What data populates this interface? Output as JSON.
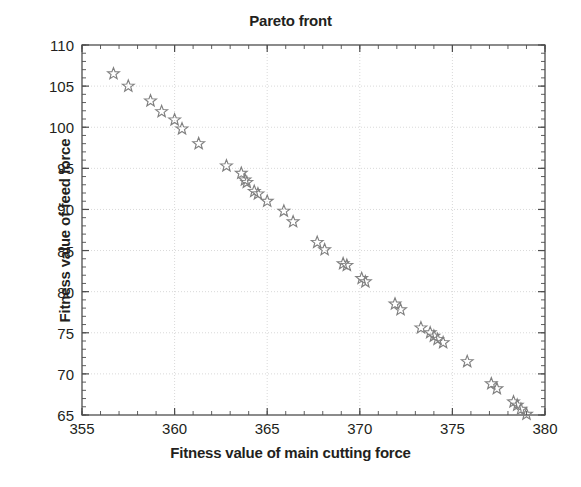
{
  "chart_data": {
    "type": "scatter",
    "title": "Pareto front",
    "xlabel": "Fitness value of main cutting force",
    "ylabel": "Fitness value of feed force",
    "xlim": [
      355,
      380
    ],
    "ylim": [
      65,
      110
    ],
    "xticks": [
      355,
      360,
      365,
      370,
      375,
      380
    ],
    "yticks": [
      65,
      70,
      75,
      80,
      85,
      90,
      95,
      100,
      105,
      110
    ],
    "grid": true,
    "legend": null,
    "marker": "star-outline",
    "marker_color": "#808080",
    "series": [
      {
        "name": "Pareto front solutions",
        "points": [
          [
            356.7,
            106.5
          ],
          [
            357.5,
            105.0
          ],
          [
            358.7,
            103.2
          ],
          [
            359.3,
            101.9
          ],
          [
            360.0,
            100.9
          ],
          [
            360.4,
            99.8
          ],
          [
            361.3,
            98.0
          ],
          [
            362.8,
            95.3
          ],
          [
            363.6,
            94.4
          ],
          [
            363.8,
            93.6
          ],
          [
            363.9,
            93.3
          ],
          [
            364.3,
            92.2
          ],
          [
            364.5,
            91.9
          ],
          [
            365.0,
            91.0
          ],
          [
            365.9,
            89.8
          ],
          [
            366.4,
            88.5
          ],
          [
            367.7,
            86.0
          ],
          [
            368.1,
            85.1
          ],
          [
            369.1,
            83.4
          ],
          [
            369.3,
            83.2
          ],
          [
            370.1,
            81.6
          ],
          [
            370.3,
            81.2
          ],
          [
            371.9,
            78.5
          ],
          [
            372.2,
            77.8
          ],
          [
            373.3,
            75.6
          ],
          [
            373.8,
            75.0
          ],
          [
            374.0,
            74.6
          ],
          [
            374.2,
            74.2
          ],
          [
            374.5,
            73.8
          ],
          [
            375.8,
            71.5
          ],
          [
            377.1,
            68.8
          ],
          [
            377.4,
            68.2
          ],
          [
            378.3,
            66.6
          ],
          [
            378.5,
            66.2
          ],
          [
            378.7,
            65.7
          ],
          [
            379.0,
            65.1
          ]
        ]
      }
    ]
  },
  "axis": {
    "x_tick_labels": [
      "355",
      "360",
      "365",
      "370",
      "375",
      "380"
    ],
    "y_tick_labels": [
      "65",
      "70",
      "75",
      "80",
      "85",
      "90",
      "95",
      "100",
      "105",
      "110"
    ]
  },
  "colors": {
    "marker": "#808080",
    "axis": "#4d4d4d",
    "grid": "#d9d9d9",
    "text": "#231f20"
  }
}
